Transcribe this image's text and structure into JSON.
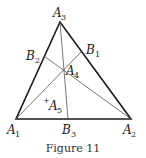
{
  "figure": {
    "caption": "Figure 11",
    "points": {
      "A1": {
        "name": "A",
        "sub": "1"
      },
      "A2": {
        "name": "A",
        "sub": "2"
      },
      "A3": {
        "name": "A",
        "sub": "3"
      },
      "A4": {
        "name": "A",
        "sub": "4"
      },
      "A5": {
        "name": "A",
        "sub": "5",
        "marker": "+"
      },
      "B1": {
        "name": "B",
        "sub": "1"
      },
      "B2": {
        "name": "B",
        "sub": "2"
      },
      "B3": {
        "name": "B",
        "sub": "3"
      }
    },
    "colors": {
      "triangle": "#1a1a1a",
      "cevians": "#555555",
      "text": "#222222"
    }
  }
}
